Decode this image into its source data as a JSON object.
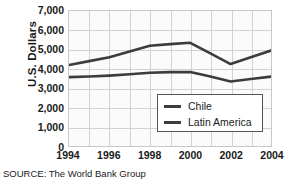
{
  "chart_data": {
    "type": "line",
    "title": "",
    "xlabel": "",
    "ylabel": "U.S. Dollars",
    "x": [
      1994,
      1995,
      1996,
      1997,
      1998,
      1999,
      2000,
      2001,
      2002,
      2003,
      2004
    ],
    "xtick_labels": [
      "1994",
      "1996",
      "1998",
      "2000",
      "2002",
      "2004"
    ],
    "xticks": [
      1994,
      1996,
      1998,
      2000,
      2002,
      2004
    ],
    "xlim": [
      1994,
      2004
    ],
    "ylim": [
      0,
      7000
    ],
    "yticks": [
      0,
      1000,
      2000,
      3000,
      4000,
      5000,
      6000,
      7000
    ],
    "ytick_labels": [
      "0",
      "1,000",
      "2,000",
      "3,000",
      "4,000",
      "5,000",
      "6,000",
      "7,000"
    ],
    "grid": true,
    "legend_position": "lower right",
    "series": [
      {
        "name": "Chile",
        "color": "#3c3c3c",
        "values": [
          4200,
          4400,
          4600,
          4900,
          5200,
          5280,
          5350,
          4800,
          4250,
          4600,
          4950
        ]
      },
      {
        "name": "Latin America",
        "color": "#3c3c3c",
        "values": [
          3570,
          3600,
          3650,
          3720,
          3800,
          3830,
          3840,
          3600,
          3340,
          3470,
          3600
        ]
      }
    ]
  },
  "legend": {
    "items": [
      {
        "label": "Chile"
      },
      {
        "label": "Latin America"
      }
    ]
  },
  "source_note": "SOURCE: The World Bank Group"
}
